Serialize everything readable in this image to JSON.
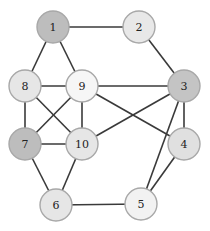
{
  "diagram": {
    "type": "undirected-graph",
    "node_radius": 16,
    "colors": {
      "dark": "#bdbdbd",
      "medium": "#dadada",
      "light": "#e6e6e6",
      "lighter": "#efefef",
      "white": "#f6f6f6",
      "edge": "#3a3a3a",
      "node_border": "#a8a8a8"
    },
    "nodes": [
      {
        "id": "1",
        "label": "1",
        "x": 53,
        "y": 27,
        "fill": "#bdbdbd"
      },
      {
        "id": "2",
        "label": "2",
        "x": 139,
        "y": 27,
        "fill": "#e8e8e8"
      },
      {
        "id": "3",
        "label": "3",
        "x": 184,
        "y": 86,
        "fill": "#c4c4c4"
      },
      {
        "id": "4",
        "label": "4",
        "x": 184,
        "y": 144,
        "fill": "#e0e0e0"
      },
      {
        "id": "5",
        "label": "5",
        "x": 141,
        "y": 204,
        "fill": "#f2f2f2"
      },
      {
        "id": "6",
        "label": "6",
        "x": 56,
        "y": 205,
        "fill": "#e6e6e6"
      },
      {
        "id": "7",
        "label": "7",
        "x": 25,
        "y": 144,
        "fill": "#bdbdbd"
      },
      {
        "id": "8",
        "label": "8",
        "x": 25,
        "y": 86,
        "fill": "#e6e6e6"
      },
      {
        "id": "9",
        "label": "9",
        "x": 82,
        "y": 86,
        "fill": "#f6f6f6"
      },
      {
        "id": "10",
        "label": "10",
        "x": 82,
        "y": 144,
        "fill": "#e6e6e6"
      }
    ],
    "edges": [
      [
        "1",
        "2"
      ],
      [
        "1",
        "8"
      ],
      [
        "1",
        "9"
      ],
      [
        "2",
        "3"
      ],
      [
        "8",
        "9"
      ],
      [
        "8",
        "7"
      ],
      [
        "8",
        "10"
      ],
      [
        "9",
        "7"
      ],
      [
        "9",
        "10"
      ],
      [
        "9",
        "3"
      ],
      [
        "9",
        "4"
      ],
      [
        "3",
        "10"
      ],
      [
        "3",
        "4"
      ],
      [
        "3",
        "5"
      ],
      [
        "7",
        "10"
      ],
      [
        "7",
        "6"
      ],
      [
        "10",
        "6"
      ],
      [
        "6",
        "5"
      ],
      [
        "4",
        "5"
      ]
    ]
  }
}
